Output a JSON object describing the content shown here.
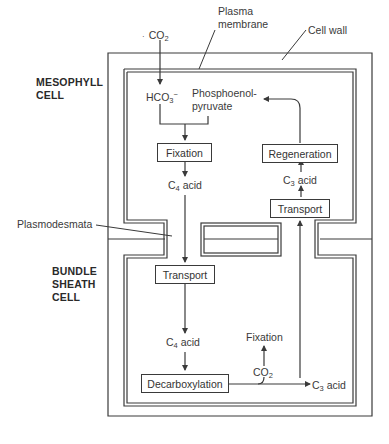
{
  "cells": {
    "mesophyll": {
      "line1": "MESOPHYLL",
      "line2": "CELL"
    },
    "bundle_sheath": {
      "line1": "BUNDLE",
      "line2": "SHEATH",
      "line3": "CELL"
    }
  },
  "structures": {
    "plasma_membrane_line1": "Plasma",
    "plasma_membrane_line2": "membrane",
    "cell_wall": "Cell wall",
    "plasmodesmata": "Plasmodesmata"
  },
  "mesophyll_labels": {
    "co2_prefix": "CO",
    "co2_sub": "2",
    "hco3_prefix": "HCO",
    "hco3_sub": "3",
    "hco3_sup": "−",
    "pep_line1": "Phosphoenol-",
    "pep_line2": "pyruvate",
    "fixation": "Fixation",
    "c4_acid_prefix": "C",
    "c4_acid_sub": "4",
    "c4_acid_suffix": " acid",
    "regeneration": "Regeneration",
    "c3_acid_prefix": "C",
    "c3_acid_sub": "3",
    "c3_acid_suffix": " acid",
    "transport": "Transport"
  },
  "bundle_sheath_labels": {
    "transport": "Transport",
    "c4_acid_prefix": "C",
    "c4_acid_sub": "4",
    "c4_acid_suffix": " acid",
    "fixation": "Fixation",
    "co2_prefix": "CO",
    "co2_sub": "2",
    "decarboxylation": "Decarboxylation",
    "c3_acid_prefix": "C",
    "c3_acid_sub": "3",
    "c3_acid_suffix": " acid"
  },
  "colors": {
    "line": "#3a3a3a",
    "background": "#ffffff"
  }
}
